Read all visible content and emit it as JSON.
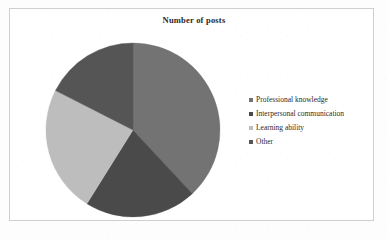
{
  "chart_data": {
    "type": "pie",
    "title": "Number of posts",
    "xlabel": "",
    "ylabel": "",
    "legend_position": "right",
    "grid": false,
    "categories": [
      "Professional knowledge",
      "Interpersonal communication",
      "Learning ability",
      "Other"
    ],
    "values": [
      38,
      21,
      24,
      17
    ],
    "colors": [
      "#737373",
      "#4a4a4a",
      "#bdbdbd",
      "#555555"
    ],
    "start_angle_deg": 0,
    "direction": "clockwise",
    "boundary_angles_deg": [
      0,
      137,
      212,
      297,
      360
    ]
  },
  "chart": {
    "title": "Number of posts"
  },
  "legend": {
    "items": [
      {
        "label": "Professional knowledge",
        "color": "#737373"
      },
      {
        "label": "Interpersonal communication",
        "color": "#4a4a4a"
      },
      {
        "label": "Learning ability",
        "color": "#bdbdbd"
      },
      {
        "label": "Other",
        "color": "#555555"
      }
    ]
  }
}
